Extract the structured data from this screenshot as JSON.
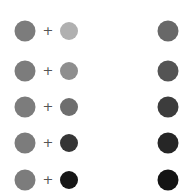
{
  "operator": "+",
  "rows": [
    {
      "y": 31,
      "base": "#7c7c7c",
      "added": "#b0b0b0",
      "result": "#686868"
    },
    {
      "y": 71,
      "base": "#7c7c7c",
      "added": "#8e8e8e",
      "result": "#545454"
    },
    {
      "y": 107,
      "base": "#7c7c7c",
      "added": "#6e6e6e",
      "result": "#3c3c3c"
    },
    {
      "y": 143,
      "base": "#7c7c7c",
      "added": "#353535",
      "result": "#262626"
    },
    {
      "y": 180,
      "base": "#7c7c7c",
      "added": "#161616",
      "result": "#141414"
    }
  ]
}
